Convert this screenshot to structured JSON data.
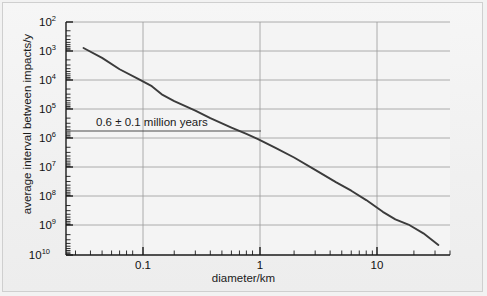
{
  "figure": {
    "background_color": "#f1f1f1",
    "frame_border_color": "#cfcfcf"
  },
  "chart_data": {
    "type": "line",
    "title": "",
    "subtitle": "",
    "xlabel": "diameter/km",
    "ylabel": "average interval between impacts/y",
    "xscale": "log",
    "yscale": "log",
    "y_axis_inverted": true,
    "xlim": [
      0.025,
      40
    ],
    "ylim": [
      100,
      10000000000
    ],
    "grid": true,
    "grid_color": "#9a9a9a",
    "legend": null,
    "line_color": "#3b3b3b",
    "xticks_major": [
      0.1,
      1,
      10
    ],
    "xtick_labels": [
      "0.1",
      "1",
      "10"
    ],
    "yticks_major": [
      100,
      1000,
      10000,
      100000,
      1000000,
      10000000,
      100000000,
      1000000000,
      10000000000
    ],
    "ytick_labels": [
      "10²",
      "10³",
      "10⁴",
      "10⁵",
      "10⁶",
      "10⁷",
      "10⁸",
      "10⁹",
      "10¹⁰"
    ],
    "ytick_bases": [
      "10",
      "10",
      "10",
      "10",
      "10",
      "10",
      "10",
      "10",
      "10"
    ],
    "ytick_exponents": [
      "2",
      "3",
      "4",
      "5",
      "6",
      "7",
      "8",
      "9",
      "10"
    ],
    "series": [
      {
        "name": "average impact interval",
        "x": [
          0.035,
          0.05,
          0.07,
          0.1,
          0.13,
          0.16,
          0.2,
          0.3,
          0.4,
          0.6,
          0.8,
          1.0,
          1.4,
          2.0,
          3.0,
          4.5,
          6.0,
          8.0,
          11.0,
          14.0,
          18.0,
          24.0,
          32.0
        ],
        "y": [
          780,
          1700,
          4200,
          9000,
          16000,
          32000,
          52000,
          110000,
          200000,
          420000,
          700000,
          1050000,
          2100000,
          4500000,
          12000000,
          32000000,
          62000000,
          130000000,
          330000000,
          600000000,
          900000000,
          1800000000,
          4500000000
        ]
      }
    ],
    "annotations": [
      {
        "text": "0.6 ± 0.1 million years",
        "value": 600000,
        "uncertainty": 100000,
        "units": "years",
        "marker_line": {
          "from_x": 0.025,
          "to_x": 1.0,
          "y": 600000
        }
      }
    ]
  }
}
